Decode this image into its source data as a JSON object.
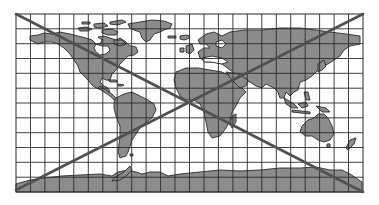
{
  "map": {
    "title": "World map with grid, crossed out",
    "projection": "Mercator-like rectangular grid",
    "frame": {
      "x": 16,
      "y": 14,
      "width": 347,
      "height": 178
    },
    "grid": {
      "columns": 24,
      "rows": 12
    },
    "colors": {
      "background": "#ffffff",
      "land": "#8c8c8c",
      "coastline": "#2a2a2a",
      "grid": "#2b2b2b",
      "cross": "#505050"
    },
    "continents": [
      "North America",
      "Greenland",
      "South America",
      "Europe",
      "Africa",
      "Asia",
      "Australia",
      "New Zealand",
      "Antarctica"
    ],
    "overlay": {
      "type": "X",
      "description": "Two diagonal lines from corner to corner crossing out the map"
    }
  }
}
